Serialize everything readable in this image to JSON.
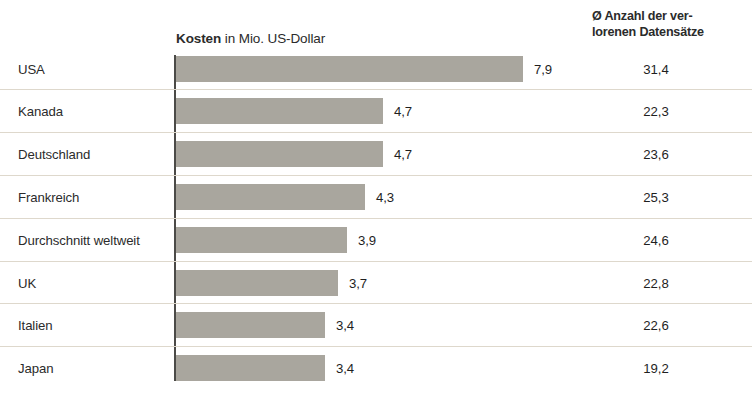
{
  "header": {
    "cost_bold": "Kosten",
    "cost_rest": " in Mio. US-Dollar",
    "records_line1": "Ø Anzahl der ver-",
    "records_line2": "lorenen Datensätze"
  },
  "colors": {
    "bar": "#a9a69e",
    "axis": "#4b4a47",
    "separator": "#ded8cc",
    "background": "#ffffff",
    "text": "#2b2b2b"
  },
  "chart_data": {
    "type": "bar",
    "title": "Kosten in Mio. US-Dollar",
    "xlabel": "",
    "ylabel": "",
    "orientation": "horizontal",
    "grid": false,
    "legend": null,
    "xlim": [
      0,
      9.6
    ],
    "categories": [
      "USA",
      "Kanada",
      "Deutschland",
      "Frankreich",
      "Durchschnitt weltweit",
      "UK",
      "Italien",
      "Japan"
    ],
    "series": [
      {
        "name": "Kosten in Mio. US-Dollar",
        "values": [
          7.9,
          4.7,
          4.7,
          4.3,
          3.9,
          3.7,
          3.4,
          3.4
        ],
        "labels": [
          "7,9",
          "4,7",
          "4,7",
          "4,3",
          "3,9",
          "3,7",
          "3,4",
          "3,4"
        ]
      },
      {
        "name": "Ø Anzahl der verlorenen Datensätze",
        "values": [
          31.4,
          22.3,
          23.6,
          25.3,
          24.6,
          22.8,
          22.6,
          19.2
        ],
        "labels": [
          "31,4",
          "22,3",
          "23,6",
          "25,3",
          "24,6",
          "22,8",
          "22,6",
          "19,2"
        ]
      }
    ]
  },
  "rows": [
    {
      "label": "USA",
      "bar_label": "7,9",
      "records": "31,4",
      "bar_width": 347
    },
    {
      "label": "Kanada",
      "bar_label": "4,7",
      "records": "22,3",
      "bar_width": 207
    },
    {
      "label": "Deutschland",
      "bar_label": "4,7",
      "records": "23,6",
      "bar_width": 207
    },
    {
      "label": "Frankreich",
      "bar_label": "4,3",
      "records": "25,3",
      "bar_width": 189
    },
    {
      "label": "Durchschnitt weltweit",
      "bar_label": "3,9",
      "records": "24,6",
      "bar_width": 171
    },
    {
      "label": "UK",
      "bar_label": "3,7",
      "records": "22,8",
      "bar_width": 162
    },
    {
      "label": "Italien",
      "bar_label": "3,4",
      "records": "22,6",
      "bar_width": 149
    },
    {
      "label": "Japan",
      "bar_label": "3,4",
      "records": "19,2",
      "bar_width": 149
    }
  ]
}
